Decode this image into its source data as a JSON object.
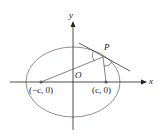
{
  "diagram": {
    "labels": {
      "y_axis": "y",
      "x_axis": "x",
      "origin": "O",
      "point": "P",
      "left_focus": "(−c, 0)",
      "right_focus": "(c, 0)"
    },
    "colors": {
      "ellipse": "#9a8f8f",
      "lines": "#333333",
      "axes": "#222222"
    }
  }
}
